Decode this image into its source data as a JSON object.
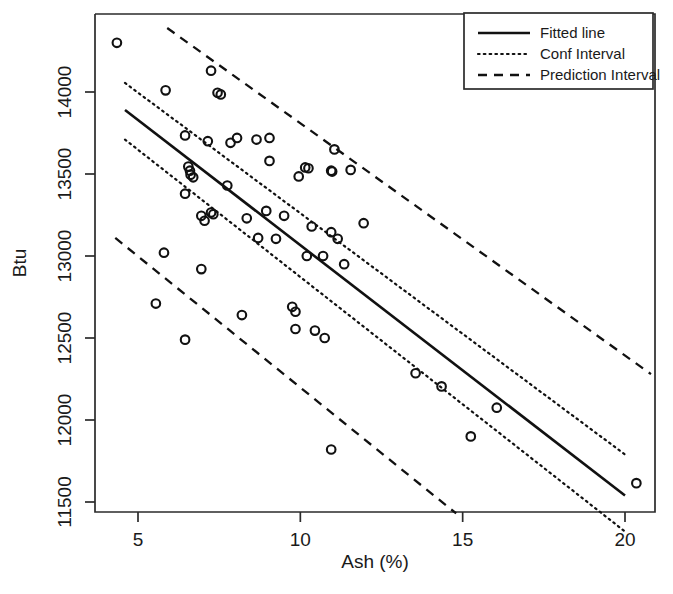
{
  "figure": {
    "width": 673,
    "height": 594,
    "background": "#ffffff",
    "ink_color": "#111111"
  },
  "chart_data": {
    "type": "scatter",
    "title": "",
    "xlabel": "Ash (%)",
    "ylabel": "Btu",
    "xlim": [
      3.8,
      21.2
    ],
    "ylim": [
      11350,
      14350
    ],
    "xticks": [
      5,
      10,
      15,
      20
    ],
    "xtick_labels": [
      "5",
      "10",
      "15",
      "20"
    ],
    "yticks": [
      11500,
      12000,
      12500,
      13000,
      13500,
      14000
    ],
    "ytick_labels": [
      "11500",
      "12000",
      "12500",
      "13000",
      "13500",
      "14000"
    ],
    "grid": false,
    "legend_position": "top-right",
    "points": [
      [
        4.35,
        14300
      ],
      [
        5.85,
        14010
      ],
      [
        7.25,
        14130
      ],
      [
        7.45,
        13995
      ],
      [
        7.55,
        13985
      ],
      [
        6.45,
        13735
      ],
      [
        8.05,
        13720
      ],
      [
        8.65,
        13710
      ],
      [
        7.85,
        13690
      ],
      [
        9.05,
        13720
      ],
      [
        7.15,
        13700
      ],
      [
        6.55,
        13545
      ],
      [
        6.6,
        13520
      ],
      [
        6.62,
        13495
      ],
      [
        6.7,
        13480
      ],
      [
        11.05,
        13650
      ],
      [
        11.55,
        13525
      ],
      [
        9.05,
        13580
      ],
      [
        10.15,
        13540
      ],
      [
        10.25,
        13535
      ],
      [
        10.95,
        13520
      ],
      [
        10.98,
        13515
      ],
      [
        9.95,
        13485
      ],
      [
        11.95,
        13200
      ],
      [
        6.45,
        13380
      ],
      [
        7.75,
        13430
      ],
      [
        7.25,
        13265
      ],
      [
        7.32,
        13255
      ],
      [
        6.95,
        13245
      ],
      [
        7.05,
        13215
      ],
      [
        8.35,
        13230
      ],
      [
        8.95,
        13275
      ],
      [
        9.5,
        13245
      ],
      [
        5.8,
        13020
      ],
      [
        8.7,
        13110
      ],
      [
        9.25,
        13105
      ],
      [
        10.35,
        13180
      ],
      [
        10.95,
        13145
      ],
      [
        11.15,
        13105
      ],
      [
        10.2,
        13000
      ],
      [
        10.7,
        13000
      ],
      [
        11.35,
        12950
      ],
      [
        6.95,
        12920
      ],
      [
        8.2,
        12640
      ],
      [
        5.55,
        12710
      ],
      [
        6.45,
        12490
      ],
      [
        9.75,
        12690
      ],
      [
        9.85,
        12660
      ],
      [
        9.85,
        12555
      ],
      [
        10.45,
        12545
      ],
      [
        10.75,
        12500
      ],
      [
        10.95,
        11820
      ],
      [
        13.55,
        12285
      ],
      [
        14.35,
        12205
      ],
      [
        15.25,
        11900
      ],
      [
        16.05,
        12075
      ],
      [
        20.35,
        11615
      ]
    ],
    "series": [
      {
        "name": "Fitted line",
        "style": "solid",
        "x": [
          4.6,
          20.0
        ],
        "y": [
          13890,
          11540
        ]
      },
      {
        "name": "Conf Interval",
        "style": "dotted",
        "upper": {
          "x": [
            4.6,
            20.0
          ],
          "y": [
            14055,
            11790
          ]
        },
        "lower": {
          "x": [
            4.6,
            20.0
          ],
          "y": [
            13710,
            11320
          ]
        }
      },
      {
        "name": "Prediction Interval",
        "style": "dashed",
        "upper": {
          "x": [
            5.9,
            20.8
          ],
          "y": [
            14390,
            12280
          ]
        },
        "lower": {
          "x": [
            4.3,
            14.8
          ],
          "y": [
            13110,
            11430
          ]
        }
      }
    ]
  },
  "legend": {
    "entries": [
      {
        "label": "Fitted line",
        "style": "solid"
      },
      {
        "label": "Conf Interval",
        "style": "dotted"
      },
      {
        "label": "Prediction Interval",
        "style": "dashed"
      }
    ]
  }
}
